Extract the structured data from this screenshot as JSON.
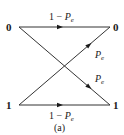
{
  "diagram": {
    "caption": "(a)",
    "inputs": [
      {
        "id": "in0",
        "label": "0"
      },
      {
        "id": "in1",
        "label": "1"
      }
    ],
    "outputs": [
      {
        "id": "out0",
        "label": "0"
      },
      {
        "id": "out1",
        "label": "1"
      }
    ],
    "edges": [
      {
        "from": "in0",
        "to": "out0",
        "label_prefix": "1 − ",
        "label_var": "P",
        "label_sub": "e"
      },
      {
        "from": "in0",
        "to": "out1",
        "label_prefix": "",
        "label_var": "P",
        "label_sub": "e"
      },
      {
        "from": "in1",
        "to": "out0",
        "label_prefix": "",
        "label_var": "P",
        "label_sub": "e"
      },
      {
        "from": "in1",
        "to": "out1",
        "label_prefix": "1 − ",
        "label_var": "P",
        "label_sub": "e"
      }
    ],
    "colors": {
      "line": "#333333",
      "text": "#1a1a1a",
      "background": "#ffffff"
    }
  }
}
